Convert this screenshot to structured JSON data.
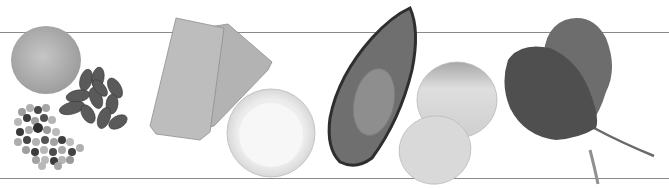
{
  "image": {
    "description": "Grayscale photo strip of foods arranged between two horizontal rules",
    "style": "grayscale",
    "rules": {
      "top_y": 32,
      "bottom_y": 178,
      "color": "#8a8a8a"
    },
    "items": [
      {
        "name": "egg",
        "label": "Egg"
      },
      {
        "name": "kidney-beans",
        "label": "Kidney beans"
      },
      {
        "name": "mixed-beans",
        "label": "Mixed beans"
      },
      {
        "name": "cheese-wedges",
        "label": "Cheese"
      },
      {
        "name": "bowl",
        "label": "Bowl of white food"
      },
      {
        "name": "avocado-half",
        "label": "Avocado"
      },
      {
        "name": "potatoes",
        "label": "Potatoes"
      },
      {
        "name": "spinach-leaves",
        "label": "Spinach"
      }
    ]
  }
}
